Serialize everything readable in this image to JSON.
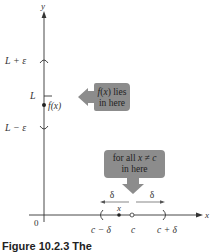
{
  "axes": {
    "x_label": "x",
    "y_label": "y",
    "origin_label": "0"
  },
  "y_marks": {
    "upper": "L + ε",
    "center": "L",
    "lower": "L − ε",
    "point_label": "f(x)"
  },
  "x_marks": {
    "left": "c − δ",
    "center": "c",
    "right": "c + δ",
    "point_label": "x",
    "delta_left": "δ",
    "delta_right": "δ"
  },
  "callouts": {
    "y_callout": {
      "line1": "f(x) lies",
      "line2": "in here"
    },
    "x_callout": {
      "line1": "for all x ≠ c",
      "line2": "in here"
    }
  },
  "colors": {
    "callout_fill": "#8c8c8c",
    "axis": "#333333"
  },
  "caption": "Figure 10.2.3 The"
}
